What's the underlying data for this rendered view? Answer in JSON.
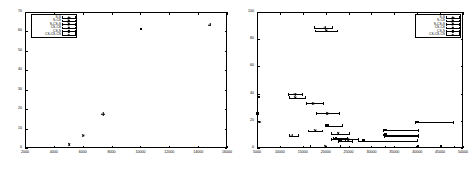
{
  "figure": {
    "panels": [
      "left",
      "right"
    ],
    "background": "#ffffff",
    "foreground": "#000000"
  },
  "legend_series": [
    {
      "label": "S-S",
      "marker": "plus"
    },
    {
      "label": "S-CS",
      "marker": "cross"
    },
    {
      "label": "S-CS-S",
      "marker": "star"
    },
    {
      "label": "CS-CS",
      "marker": "obox"
    },
    {
      "label": "CS-S",
      "marker": "fbox"
    },
    {
      "label": "CS-CS-CS",
      "marker": "ocir"
    }
  ],
  "chart_data": [
    {
      "type": "scatter",
      "panel": "left",
      "title": "",
      "xlabel": "",
      "ylabel": "",
      "xlim": [
        2000,
        16000
      ],
      "ylim": [
        0,
        70
      ],
      "xticks": [
        2000,
        4000,
        6000,
        8000,
        10000,
        12000,
        14000,
        16000
      ],
      "yticks": [
        0,
        10,
        20,
        30,
        40,
        50,
        60,
        70
      ],
      "grid": false,
      "legend_position": "top-left",
      "series": [
        {
          "name": "S-S",
          "marker": "plus",
          "points": [
            {
              "x": 7400,
              "y": 17.5
            },
            {
              "x": 14800,
              "y": 63.5
            }
          ]
        },
        {
          "name": "S-CS",
          "marker": "cross",
          "points": [
            {
              "x": 6000,
              "y": 6.5
            }
          ]
        },
        {
          "name": "S-CS-S",
          "marker": "star",
          "points": [
            {
              "x": 5050,
              "y": 1.6
            }
          ]
        },
        {
          "name": "CS-CS",
          "marker": "obox",
          "points": [
            {
              "x": 10050,
              "y": 61.0
            }
          ]
        },
        {
          "name": "CS-S",
          "marker": "fbox",
          "points": []
        },
        {
          "name": "CS-CS-CS",
          "marker": "ocir",
          "points": []
        }
      ]
    },
    {
      "type": "scatter",
      "panel": "right",
      "title": "",
      "xlabel": "",
      "ylabel": "",
      "xlim": [
        5000,
        50000
      ],
      "ylim": [
        0,
        100
      ],
      "xticks": [
        5000,
        10000,
        15000,
        20000,
        25000,
        30000,
        35000,
        40000,
        45000,
        50000
      ],
      "yticks": [
        0,
        20,
        40,
        60,
        80,
        100
      ],
      "grid": false,
      "legend_position": "top-right",
      "series": [
        {
          "name": "S-S",
          "marker": "plus",
          "points": [
            {
              "x": 19800,
              "y": 88.5,
              "xerr_low": 17400,
              "xerr_high": 21300
            },
            {
              "x": 13300,
              "y": 39.5,
              "xerr_low": 11800,
              "xerr_high": 14900
            },
            {
              "x": 12600,
              "y": 9.0,
              "xerr_low": 12000,
              "xerr_high": 13900
            }
          ]
        },
        {
          "name": "S-CS",
          "marker": "cross",
          "points": [
            {
              "x": 20100,
              "y": 86.0,
              "xerr_low": 17600,
              "xerr_high": 22400
            },
            {
              "x": 13400,
              "y": 37.0,
              "xerr_low": 12000,
              "xerr_high": 15400
            },
            {
              "x": 17200,
              "y": 33.0,
              "xerr_low": 15600,
              "xerr_high": 19400
            },
            {
              "x": 17600,
              "y": 12.5,
              "xerr_low": 16200,
              "xerr_high": 19200
            }
          ]
        },
        {
          "name": "S-CS-S",
          "marker": "star",
          "points": [
            {
              "x": 20200,
              "y": 25.5,
              "xerr_low": 17900,
              "xerr_high": 23000
            },
            {
              "x": 22600,
              "y": 10.5,
              "xerr_low": 21100,
              "xerr_high": 25000
            },
            {
              "x": 24900,
              "y": 6.5,
              "xerr_low": 22900,
              "xerr_high": 27100
            },
            {
              "x": 19900,
              "y": 1.0,
              "xerr_low": 16500,
              "xerr_high": 23200
            }
          ]
        },
        {
          "name": "CS-CS",
          "marker": "obox",
          "points": [
            {
              "x": 40100,
              "y": 19.0,
              "xerr_low": 39600,
              "xerr_high": 47800
            },
            {
              "x": 33200,
              "y": 13.0,
              "xerr_low": 32600,
              "xerr_high": 40200
            },
            {
              "x": 33300,
              "y": 8.5,
              "xerr_low": 32700,
              "xerr_high": 40100
            },
            {
              "x": 28300,
              "y": 5.5,
              "xerr_low": 27000,
              "xerr_high": 40000
            },
            {
              "x": 45300,
              "y": 0.8,
              "xerr_low": 33000,
              "xerr_high": 49700
            }
          ]
        },
        {
          "name": "CS-S",
          "marker": "fbox",
          "points": [
            {
              "x": 5500,
              "y": 37.0
            },
            {
              "x": 5200,
              "y": 25.0
            },
            {
              "x": 20500,
              "y": 16.5,
              "xerr_low": 19900,
              "xerr_high": 23500
            },
            {
              "x": 22400,
              "y": 7.0,
              "xerr_low": 21500,
              "xerr_high": 24600
            },
            {
              "x": 23400,
              "y": 5.0,
              "xerr_low": 22600,
              "xerr_high": 25800
            },
            {
              "x": 33200,
              "y": 9.5,
              "xerr_low": 32600,
              "xerr_high": 40100
            },
            {
              "x": 40300,
              "y": 0.8,
              "xerr_low": 39800,
              "xerr_high": 48000
            }
          ]
        },
        {
          "name": "CS-CS-CS",
          "marker": "ocir",
          "points": [
            {
              "x": 5600,
              "y": 19.0
            },
            {
              "x": 22200,
              "y": 6.5,
              "xerr_low": 21100,
              "xerr_high": 24200
            }
          ]
        }
      ]
    }
  ]
}
